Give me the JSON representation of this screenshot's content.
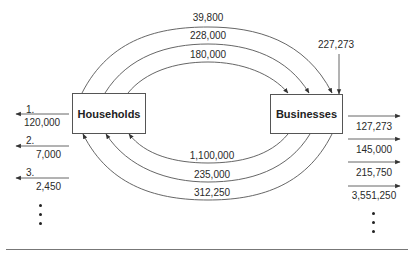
{
  "nodes": {
    "households": {
      "label": "Households"
    },
    "businesses": {
      "label": "Businesses"
    }
  },
  "flows_top": [
    {
      "label": "39,800",
      "from": "households",
      "to": "businesses"
    },
    {
      "label": "228,000",
      "from": "households",
      "to": "businesses"
    },
    {
      "label": "180,000",
      "from": "households",
      "to": "businesses"
    }
  ],
  "flows_bottom": [
    {
      "label": "1,100,000",
      "from": "businesses",
      "to": "households"
    },
    {
      "label": "235,000",
      "from": "businesses",
      "to": "households"
    },
    {
      "label": "312,250",
      "from": "businesses",
      "to": "households"
    }
  ],
  "inflow_businesses": {
    "label": "227,273"
  },
  "household_outflows": [
    {
      "index": "1.",
      "value": "120,000"
    },
    {
      "index": "2.",
      "value": "7,000"
    },
    {
      "index": "3.",
      "value": "2,450"
    }
  ],
  "business_outflows": [
    {
      "value": "127,273"
    },
    {
      "value": "145,000"
    },
    {
      "value": "215,750"
    },
    {
      "value": "3,551,250"
    }
  ],
  "colors": {
    "line": "#555555",
    "text": "#2a2a2a"
  }
}
